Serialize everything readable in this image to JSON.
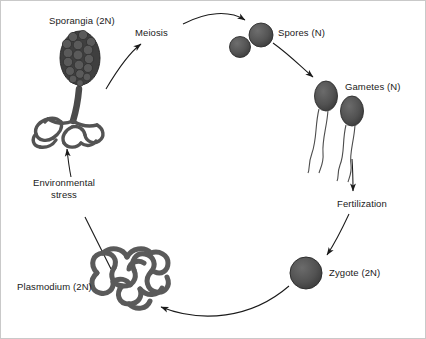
{
  "figure": {
    "background_color": "#ffffff",
    "border_color": "#c9c9c9",
    "ink_color": "#1a1a1a",
    "organism_fill": "#4d4d4d",
    "organism_stroke": "#2b2b2b"
  },
  "labels": {
    "sporangia": "Sporangia (2N)",
    "meiosis": "Meiosis",
    "spores": "Spores (N)",
    "gametes": "Gametes (N)",
    "fertilization": "Fertilization",
    "zygote": "Zygote (2N)",
    "plasmodium": "Plasmodium (2N)",
    "environmental_stress": "Environmental stress"
  },
  "stages": [
    {
      "id": "sporangia",
      "label": "Sporangia (2N)",
      "ploidy": "2N",
      "x": 90,
      "y": 95
    },
    {
      "id": "spores",
      "label": "Spores (N)",
      "ploidy": "N",
      "x": 252,
      "y": 38
    },
    {
      "id": "gametes",
      "label": "Gametes (N)",
      "ploidy": "N",
      "x": 330,
      "y": 110
    },
    {
      "id": "zygote",
      "label": "Zygote (2N)",
      "ploidy": "2N",
      "x": 305,
      "y": 272
    },
    {
      "id": "plasmodium",
      "label": "Plasmodium (2N)",
      "ploidy": "2N",
      "x": 118,
      "y": 290
    }
  ],
  "transitions": [
    {
      "id": "meiosis",
      "label": "Meiosis",
      "from": "sporangia",
      "to": "spores"
    },
    {
      "id": "gamete-formation",
      "label": "",
      "from": "spores",
      "to": "gametes"
    },
    {
      "id": "fertilization",
      "label": "Fertilization",
      "from": "gametes",
      "to": "zygote"
    },
    {
      "id": "zygote-to-plasmodium",
      "label": "",
      "from": "zygote",
      "to": "plasmodium"
    },
    {
      "id": "environmental-stress",
      "label": "Environmental stress",
      "from": "plasmodium",
      "to": "sporangia"
    }
  ]
}
